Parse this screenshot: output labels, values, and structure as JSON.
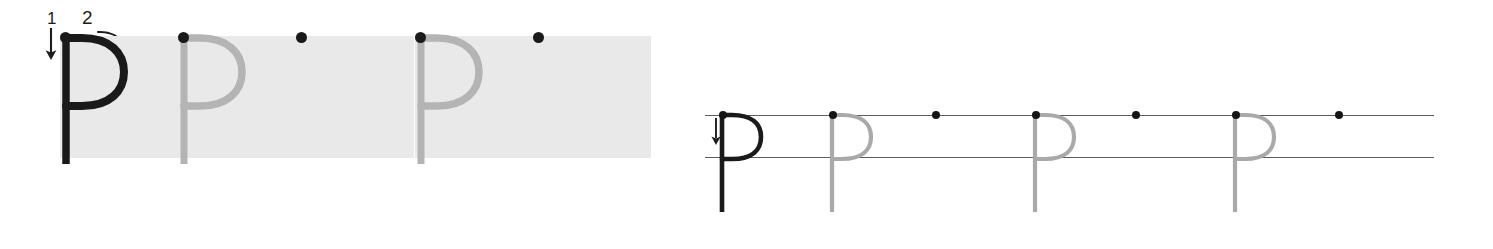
{
  "worksheet": {
    "title": "Letter P handwriting practice worksheet",
    "letter": "P",
    "letter_lowercase": "p",
    "colors": {
      "box_background": "#e9e9e9",
      "model_stroke": "#1a1a1a",
      "trace_stroke": "#b4b4b4",
      "start_dot": "#151515",
      "rule_line": "#5c5c5c",
      "page_background": "#ffffff"
    },
    "box_section": {
      "name": "boxed-letter-practice-row",
      "box_width": 118,
      "box_height": 122,
      "box_top": 36,
      "boxes": [
        {
          "index": 1,
          "left": 60,
          "type": "model",
          "letter": "P",
          "has_start_dot": true,
          "has_stroke_guides": true
        },
        {
          "index": 2,
          "left": 178,
          "type": "trace",
          "letter": "P",
          "has_start_dot": true,
          "has_stroke_guides": false
        },
        {
          "index": 3,
          "left": 296,
          "type": "blank",
          "letter": "",
          "has_start_dot": true,
          "has_stroke_guides": false
        },
        {
          "index": 4,
          "left": 415,
          "type": "trace",
          "letter": "P",
          "has_start_dot": true,
          "has_stroke_guides": false
        },
        {
          "index": 5,
          "left": 533,
          "type": "blank",
          "letter": "",
          "has_start_dot": true,
          "has_stroke_guides": false
        }
      ],
      "stroke_guides": [
        {
          "order": "1",
          "label": "1",
          "label_left": 44,
          "label_top": 12,
          "arrow": "down",
          "description": "vertical stem drawn downward"
        },
        {
          "order": "2",
          "label": "2",
          "label_left": 84,
          "label_top": 10,
          "arrow": "curve-clockwise",
          "description": "bowl curves right then back to stem"
        }
      ]
    },
    "line_section": {
      "name": "ruled-line-letter-practice-row",
      "top_rule_y": 115,
      "mid_rule_y": 157,
      "rule_left": 705,
      "rule_right": 1434,
      "descender_bottom": 214,
      "arrow": {
        "label": "down-arrow",
        "left": 712,
        "top": 118
      },
      "slots": [
        {
          "index": 1,
          "x": 722,
          "type": "model",
          "letter": "p",
          "has_start_dot": true
        },
        {
          "index": 2,
          "x": 832,
          "type": "trace",
          "letter": "p",
          "has_start_dot": true
        },
        {
          "index": 3,
          "x": 935,
          "type": "blank",
          "letter": "",
          "has_start_dot": true
        },
        {
          "index": 4,
          "x": 1035,
          "type": "trace",
          "letter": "p",
          "has_start_dot": true
        },
        {
          "index": 5,
          "x": 1135,
          "type": "blank",
          "letter": "",
          "has_start_dot": true
        },
        {
          "index": 6,
          "x": 1235,
          "type": "trace",
          "letter": "p",
          "has_start_dot": true
        },
        {
          "index": 7,
          "x": 1338,
          "type": "blank",
          "letter": "",
          "has_start_dot": true
        }
      ]
    }
  }
}
